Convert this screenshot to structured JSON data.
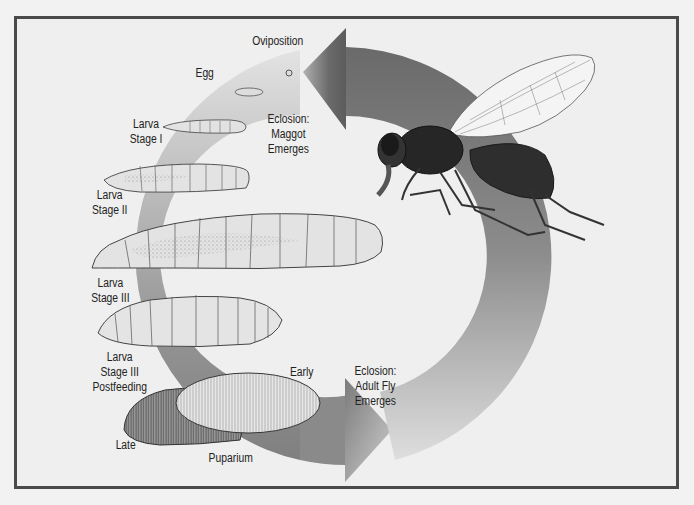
{
  "diagram": {
    "type": "life-cycle",
    "subject": "fly",
    "labels": {
      "oviposition": "Oviposition",
      "egg": "Egg",
      "eclosion_maggot": [
        "Eclosion:",
        "Maggot",
        "Emerges"
      ],
      "larva_1": [
        "Larva",
        "Stage I"
      ],
      "larva_2": [
        "Larva",
        "Stage II"
      ],
      "larva_3": [
        "Larva",
        "Stage III"
      ],
      "larva_3_post": [
        "Larva",
        "Stage III",
        "Postfeeding"
      ],
      "early": "Early",
      "late": "Late",
      "puparium": "Puparium",
      "eclosion_adult": [
        "Eclosion:",
        "Adult Fly",
        "Emerges"
      ]
    },
    "stages": [
      "Egg",
      "Larva Stage I",
      "Larva Stage II",
      "Larva Stage III",
      "Larva Stage III Postfeeding",
      "Puparium (Early)",
      "Puparium (Late)",
      "Adult Fly"
    ],
    "colors": {
      "frame_border": "#4a4a4a",
      "background": "#efefef",
      "arrow_dark": "#6a6a6a",
      "arrow_light": "#e6e6e6",
      "larva_fill": "#e4e4e4",
      "fly_body": "#2a2a2a"
    }
  }
}
